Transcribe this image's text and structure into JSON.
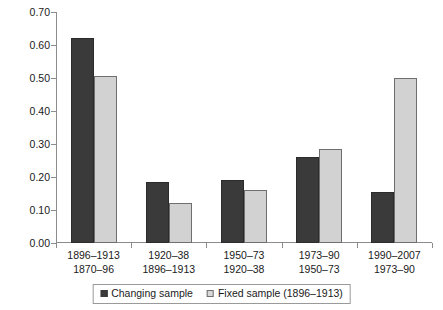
{
  "chart_data": {
    "type": "bar",
    "title": "",
    "xlabel": "",
    "ylabel": "",
    "ylim": [
      0.0,
      0.7
    ],
    "ytick_step": 0.1,
    "grid": false,
    "legend_position": "bottom-center",
    "ytick_labels": [
      "0.00",
      "0.10",
      "0.20",
      "0.30",
      "0.40",
      "0.50",
      "0.60",
      "0.70"
    ],
    "ytick_values": [
      0.0,
      0.1,
      0.2,
      0.3,
      0.4,
      0.5,
      0.6,
      0.7
    ],
    "categories": [
      {
        "line1": "1896–1913",
        "line2": "1870–96"
      },
      {
        "line1": "1920–38",
        "line2": "1896–1913"
      },
      {
        "line1": "1950–73",
        "line2": "1920–38"
      },
      {
        "line1": "1973–90",
        "line2": "1950–73"
      },
      {
        "line1": "1990–2007",
        "line2": "1973–90"
      }
    ],
    "series": [
      {
        "name": "Changing sample",
        "color": "#3a3a3a",
        "values": [
          0.62,
          0.185,
          0.19,
          0.26,
          0.155
        ]
      },
      {
        "name": "Fixed sample (1896–1913)",
        "color": "#d2d2d2",
        "values": [
          0.505,
          0.12,
          0.16,
          0.285,
          0.5
        ]
      }
    ]
  },
  "legend": {
    "items": [
      {
        "label": "Changing sample",
        "swatch": "dark"
      },
      {
        "label": "Fixed sample (1896–1913)",
        "swatch": "light"
      }
    ]
  },
  "colors": {
    "series_dark": "#3a3a3a",
    "series_light": "#d2d2d2",
    "axis": "#8c8c8c",
    "text": "#1a1a1a",
    "background": "#ffffff"
  }
}
